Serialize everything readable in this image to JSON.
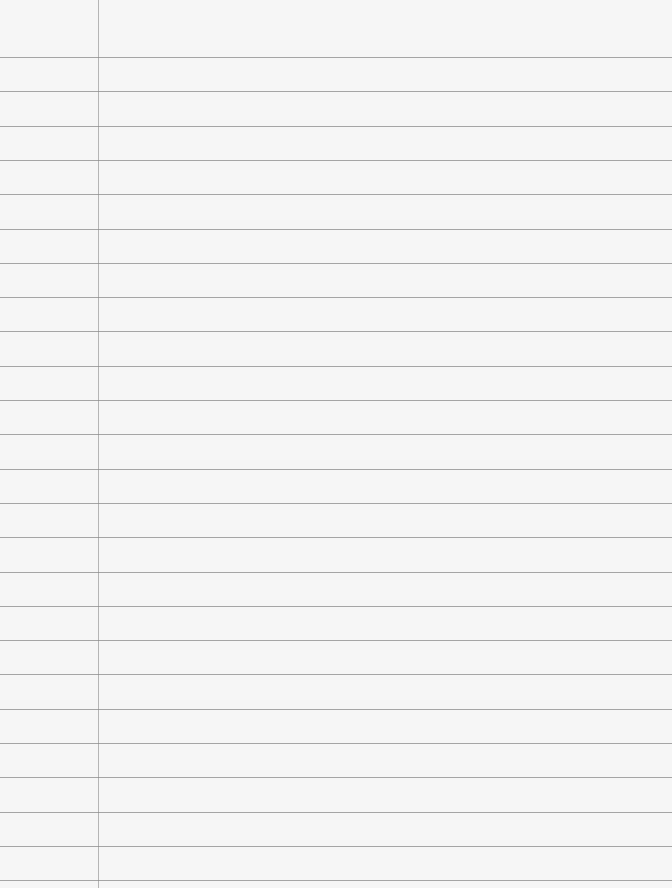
{
  "document": {
    "type": "lined-paper",
    "ruled_line_count": 25,
    "has_margin_line": true,
    "text": "",
    "colors": {
      "paper": "#f6f6f6",
      "rule": "#8a8a8a",
      "margin": "#9a9a9a"
    }
  }
}
